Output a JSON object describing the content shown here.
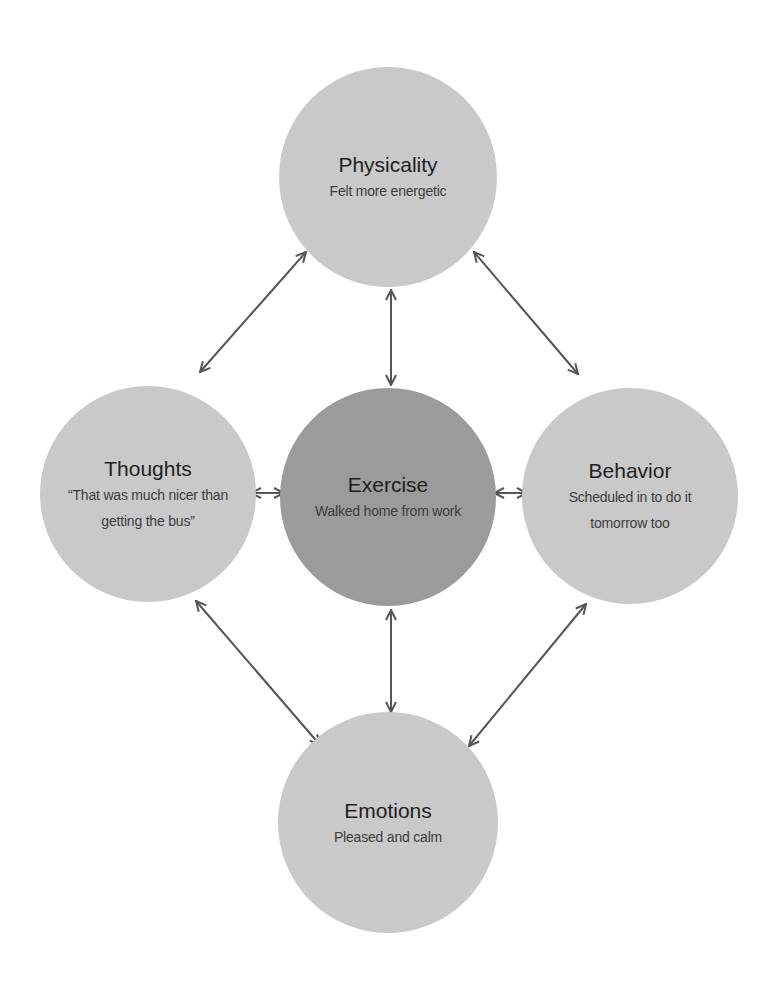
{
  "diagram": {
    "colors": {
      "outer_node_fill": "#c9c9c9",
      "center_node_fill": "#9b9b9b",
      "arrow": "#555555",
      "title_text": "#1e1e1e",
      "desc_text": "#3c3c3c",
      "background": "#ffffff"
    },
    "nodes": {
      "physicality": {
        "title": "Physicality",
        "lines": [
          "Felt more energetic"
        ]
      },
      "thoughts": {
        "title": "Thoughts",
        "lines": [
          "“That was much nicer than",
          "getting the bus”"
        ]
      },
      "exercise": {
        "title": "Exercise",
        "lines": [
          "Walked home from work"
        ]
      },
      "behavior": {
        "title": "Behavior",
        "lines": [
          "Scheduled in to do it",
          "tomorrow too"
        ]
      },
      "emotions": {
        "title": "Emotions",
        "lines": [
          "Pleased and calm"
        ]
      }
    },
    "connections": [
      {
        "from": "Physicality",
        "to": "Thoughts",
        "type": "bidirectional"
      },
      {
        "from": "Physicality",
        "to": "Exercise",
        "type": "bidirectional"
      },
      {
        "from": "Physicality",
        "to": "Behavior",
        "type": "bidirectional"
      },
      {
        "from": "Thoughts",
        "to": "Exercise",
        "type": "bidirectional"
      },
      {
        "from": "Exercise",
        "to": "Behavior",
        "type": "bidirectional"
      },
      {
        "from": "Thoughts",
        "to": "Emotions",
        "type": "bidirectional"
      },
      {
        "from": "Exercise",
        "to": "Emotions",
        "type": "bidirectional"
      },
      {
        "from": "Behavior",
        "to": "Emotions",
        "type": "bidirectional"
      }
    ]
  }
}
